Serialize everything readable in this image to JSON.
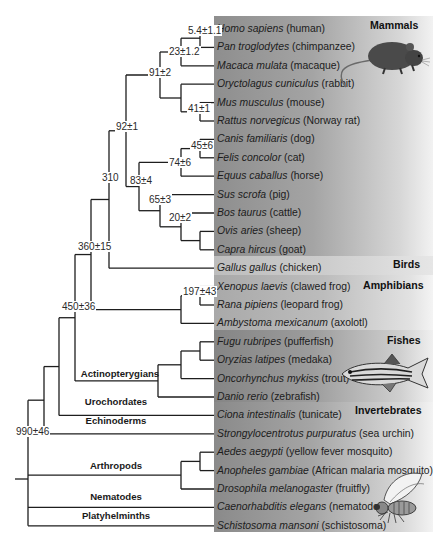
{
  "groups": [
    {
      "id": "mammals",
      "label": "Mammals"
    },
    {
      "id": "birds",
      "label": "Birds"
    },
    {
      "id": "amphibians",
      "label": "Amphibians"
    },
    {
      "id": "fishes",
      "label": "Fishes"
    },
    {
      "id": "invertebrates",
      "label": "Invertebrates"
    }
  ],
  "species": [
    {
      "latin": "Homo sapiens",
      "common": "(human)"
    },
    {
      "latin": "Pan troglodytes",
      "common": "(chimpanzee)"
    },
    {
      "latin": "Macaca mulata",
      "common": "(macaque)"
    },
    {
      "latin": "Oryctolagus cuniculus",
      "common": "(rabbit)"
    },
    {
      "latin": "Mus musculus",
      "common": "(mouse)"
    },
    {
      "latin": "Rattus norvegicus",
      "common": "(Norway rat)"
    },
    {
      "latin": "Canis familiaris",
      "common": "(dog)"
    },
    {
      "latin": "Felis concolor",
      "common": "(cat)"
    },
    {
      "latin": "Equus caballus",
      "common": "(horse)"
    },
    {
      "latin": "Sus scrofa",
      "common": "(pig)"
    },
    {
      "latin": "Bos taurus",
      "common": "(cattle)"
    },
    {
      "latin": "Ovis aries",
      "common": "(sheep)"
    },
    {
      "latin": "Capra hircus",
      "common": "(goat)"
    },
    {
      "latin": "Gallus gallus",
      "common": "(chicken)"
    },
    {
      "latin": "Xenopus laevis",
      "common": "(clawed frog)"
    },
    {
      "latin": "Rana pipiens",
      "common": "(leopard frog)"
    },
    {
      "latin": "Ambystoma mexicanum",
      "common": "(axolotl)"
    },
    {
      "latin": "Fugu rubripes",
      "common": "(pufferfish)"
    },
    {
      "latin": "Oryzias latipes",
      "common": "(medaka)"
    },
    {
      "latin": "Oncorhynchus mykiss",
      "common": "(trout)"
    },
    {
      "latin": "Danio rerio",
      "common": "(zebrafish)"
    },
    {
      "latin": "Ciona intestinalis",
      "common": "(tunicate)"
    },
    {
      "latin": "Strongylocentrotus purpuratus",
      "common": "(sea urchin)"
    },
    {
      "latin": "Aedes aegypti",
      "common": "(yellow fever mosquito)"
    },
    {
      "latin": "Anopheles gambiae",
      "common": "(African malaria mosquito)"
    },
    {
      "latin": "Drosophila melanogaster",
      "common": "(fruitfly)"
    },
    {
      "latin": "Caenorhabditis elegans",
      "common": "(nematode)"
    },
    {
      "latin": "Schistosoma mansoni",
      "common": "(schistosoma)"
    }
  ],
  "divergence_times": {
    "human_chimp": "5.4±1.1",
    "hominid_macaque": "23±1.2",
    "primates_rodents": "91±2",
    "mouse_rat": "41±1",
    "euarchontoglires_laurasiatheria": "92±1",
    "dog_cat": "45±6",
    "carnivores_horse": "74±6",
    "laurasiatheria": "83±4",
    "pig_ruminants": "65±3",
    "cattle_sheep_goat": "20±2",
    "mammals_birds": "310",
    "amniotes_amphibians": "360±15",
    "xenopus_rana": "197±43",
    "tetrapods_fishes": "450±36",
    "bilateria": "990±46"
  },
  "clades": {
    "actinopterygians": "Actinopterygians",
    "urochordates": "Urochordates",
    "echinoderms": "Echinoderms",
    "arthropods": "Arthropods",
    "nematodes": "Nematodes",
    "platyhelminths": "Platyhelminths"
  },
  "illustrations": [
    "mouse",
    "zebrafish",
    "fruitfly"
  ]
}
